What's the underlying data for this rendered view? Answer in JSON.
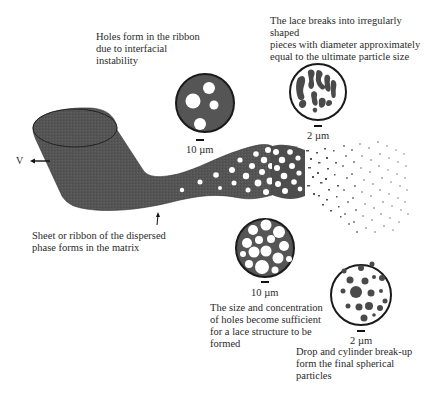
{
  "figure": {
    "velocity_label": "V",
    "colors": {
      "phase": "#555555",
      "phase_dark": "#3a3a3a",
      "outline": "#1a1a1a",
      "background": "#ffffff",
      "text": "#2a2a2a"
    }
  },
  "captions": {
    "holes_form": "Holes form in the ribbon\ndue to interfacial\ninstability",
    "lace_breaks": "The lace breaks into irregularly shaped\npieces with diameter approximately\nequal to the ultimate particle size",
    "sheet_forms": "Sheet or ribbon of the dispersed\nphase forms in the matrix",
    "lace_structure": "The size and concentration\nof holes become sufficient\nfor a lace structure to be\nformed",
    "final_particles": "Drop and cylinder break-up\nform the final spherical\nparticles"
  },
  "insets": [
    {
      "id": "holes",
      "scale_label": "10 µm",
      "description": "Dark disc with a few round holes"
    },
    {
      "id": "lace",
      "scale_label": "10 µm",
      "description": "Dark disc with many packed holes forming a lace"
    },
    {
      "id": "irregular",
      "scale_label": "2 µm",
      "description": "Irregular dark fragments"
    },
    {
      "id": "drops",
      "scale_label": "2 µm",
      "description": "Spherical dark droplets"
    }
  ]
}
